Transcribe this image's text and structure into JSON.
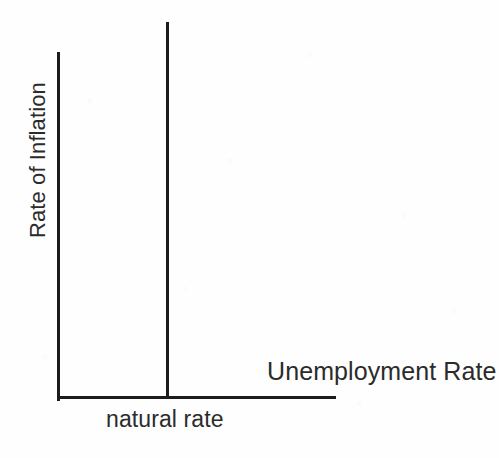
{
  "figure": {
    "background_color": "#fefefe",
    "ink_color": "#1c1c1c",
    "text_color": "#2b2b2b"
  },
  "chart_data": {
    "type": "line",
    "title": "",
    "subtitle": "",
    "xlabel": "Unemployment Rate",
    "ylabel": "Rate of Inflation",
    "xlim": [
      0,
      100
    ],
    "ylim": [
      0,
      100
    ],
    "grid": false,
    "legend": null,
    "xticks": [],
    "yticks": [],
    "xticklabels": [],
    "yticklabels": [],
    "series": [
      {
        "name": "Long-Run Phillips Curve",
        "type": "vertical-line",
        "x": [
          39.2,
          39.2
        ],
        "y": [
          0,
          108
        ],
        "description": "Vertical line at the natural rate of unemployment spanning the full height of the plot and extending above the top of the y-axis"
      }
    ],
    "annotations": [
      {
        "text": "natural rate",
        "x": 39.2,
        "y": -8,
        "placement": "below-x-axis",
        "description": "Labels the x-position of the vertical long-run Phillips curve"
      },
      {
        "text": "Unemployment Rate",
        "x": 96,
        "y": 11,
        "placement": "above-x-axis-right",
        "description": "Axis title placed inside the plot near the right end of the horizontal axis"
      },
      {
        "text": "Rate of Inflation",
        "x": -8,
        "y": 72,
        "placement": "left-of-y-axis-rotated",
        "description": "Axis title rotated 90 degrees counter-clockwise along the vertical axis"
      }
    ]
  },
  "labels": {
    "y_axis": "Rate of Inflation",
    "x_axis": "Unemployment Rate",
    "natural_rate": "natural rate"
  }
}
